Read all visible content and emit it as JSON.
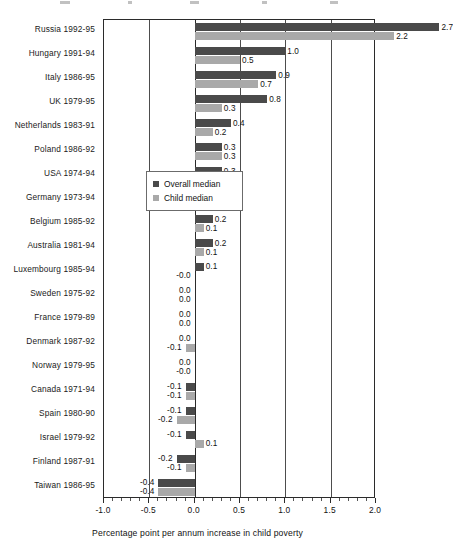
{
  "chart_data": {
    "type": "bar",
    "orientation": "horizontal",
    "title": "",
    "xlabel": "Percentage point per annum increase in child poverty",
    "ylabel": "",
    "xlim": [
      -1.0,
      2.0
    ],
    "xticks": [
      "-1.0",
      "-0.5",
      "0.0",
      "0.5",
      "1.0",
      "1.5",
      "2.0"
    ],
    "xtick_values": [
      -1.0,
      -0.5,
      0.0,
      0.5,
      1.0,
      1.5,
      2.0
    ],
    "grid": true,
    "gridlines_at": [
      -0.5,
      0.0,
      0.5,
      1.0,
      1.5
    ],
    "legend_position": "middle-right-inside",
    "categories": [
      "Russia 1992-95",
      "Hungary 1991-94",
      "Italy 1986-95",
      "UK 1979-95",
      "Netherlands 1983-91",
      "Poland 1986-92",
      "USA 1974-94",
      "Germany 1973-94",
      "Belgium 1985-92",
      "Australia 1981-94",
      "Luxembourg 1985-94",
      "Sweden 1975-92",
      "France 1979-89",
      "Denmark 1987-92",
      "Norway 1979-95",
      "Canada 1971-94",
      "Spain 1980-90",
      "Israel 1979-92",
      "Finland 1987-91",
      "Taiwan 1986-95"
    ],
    "series": [
      {
        "name": "Overall median",
        "color": "#4a4a4a",
        "values": [
          2.7,
          1.0,
          0.9,
          0.8,
          0.4,
          0.3,
          0.3,
          0.2,
          0.2,
          0.2,
          0.1,
          0.0,
          0.0,
          0.0,
          0.0,
          -0.1,
          -0.1,
          -0.1,
          -0.2,
          -0.4
        ],
        "labels": [
          "2.7",
          "1.0",
          "0.9",
          "0.8",
          "0.4",
          "0.3",
          "0.3",
          "0.2",
          "0.2",
          "0.2",
          "0.1",
          "0.0",
          "0.0",
          "0.0",
          "0.0",
          "-0.1",
          "-0.1",
          "-0.1",
          "-0.2",
          "-0.4"
        ]
      },
      {
        "name": "Child median",
        "color": "#a9a9a9",
        "values": [
          2.2,
          0.5,
          0.7,
          0.3,
          0.2,
          0.3,
          0.1,
          0.1,
          0.1,
          0.1,
          -0.0,
          0.0,
          0.0,
          -0.1,
          -0.0,
          -0.1,
          -0.2,
          0.1,
          -0.1,
          -0.4
        ],
        "labels": [
          "2.2",
          "0.5",
          "0.7",
          "0.3",
          "0.2",
          "0.3",
          "0.1",
          "0.1",
          "0.1",
          "0.1",
          "-0.0",
          "0.0",
          "0.0",
          "-0.1",
          "-0.0",
          "-0.1",
          "-0.2",
          "0.1",
          "-0.1",
          "-0.4"
        ]
      }
    ]
  },
  "legend": {
    "entries": [
      {
        "label": "Overall median",
        "color": "#4a4a4a"
      },
      {
        "label": "Child median",
        "color": "#a9a9a9"
      }
    ]
  },
  "axis": {
    "x_title": "Percentage point per annum increase in child poverty"
  }
}
